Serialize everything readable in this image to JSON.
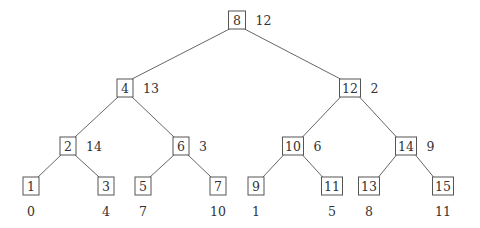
{
  "diagram": {
    "type": "binary-tree",
    "colors": {
      "edge": "#555555",
      "box_stroke": "#555555",
      "text": "#333333",
      "background": "#ffffff"
    },
    "nodes": [
      {
        "id": "n8",
        "key": "8",
        "value": "12",
        "x": 237,
        "y": 20,
        "w": 17,
        "value_pos": "right"
      },
      {
        "id": "n4",
        "key": "4",
        "value": "13",
        "x": 125,
        "y": 88,
        "w": 16,
        "value_pos": "right"
      },
      {
        "id": "n12",
        "key": "12",
        "value": "2",
        "x": 350,
        "y": 88,
        "w": 21,
        "value_pos": "right"
      },
      {
        "id": "n2",
        "key": "2",
        "value": "14",
        "x": 68,
        "y": 146,
        "w": 16,
        "value_pos": "right"
      },
      {
        "id": "n6",
        "key": "6",
        "value": "3",
        "x": 181,
        "y": 146,
        "w": 16,
        "value_pos": "right"
      },
      {
        "id": "n10",
        "key": "10",
        "value": "6",
        "x": 293,
        "y": 146,
        "w": 21,
        "value_pos": "right"
      },
      {
        "id": "n14",
        "key": "14",
        "value": "9",
        "x": 406,
        "y": 146,
        "w": 21,
        "value_pos": "right"
      },
      {
        "id": "n1",
        "key": "1",
        "value": "0",
        "x": 31,
        "y": 186,
        "w": 16,
        "value_pos": "below"
      },
      {
        "id": "n3",
        "key": "3",
        "value": "4",
        "x": 106,
        "y": 186,
        "w": 16,
        "value_pos": "below"
      },
      {
        "id": "n5",
        "key": "5",
        "value": "7",
        "x": 143,
        "y": 186,
        "w": 16,
        "value_pos": "below"
      },
      {
        "id": "n7",
        "key": "7",
        "value": "10",
        "x": 218,
        "y": 186,
        "w": 16,
        "value_pos": "below"
      },
      {
        "id": "n9",
        "key": "9",
        "value": "1",
        "x": 256,
        "y": 186,
        "w": 16,
        "value_pos": "below"
      },
      {
        "id": "n11",
        "key": "11",
        "value": "5",
        "x": 332,
        "y": 186,
        "w": 21,
        "value_pos": "below"
      },
      {
        "id": "n13",
        "key": "13",
        "value": "8",
        "x": 369,
        "y": 186,
        "w": 21,
        "value_pos": "below"
      },
      {
        "id": "n15",
        "key": "15",
        "value": "11",
        "x": 443,
        "y": 186,
        "w": 21,
        "value_pos": "below"
      }
    ],
    "edges": [
      [
        "n8",
        "n4"
      ],
      [
        "n8",
        "n12"
      ],
      [
        "n4",
        "n2"
      ],
      [
        "n4",
        "n6"
      ],
      [
        "n12",
        "n10"
      ],
      [
        "n12",
        "n14"
      ],
      [
        "n2",
        "n1"
      ],
      [
        "n2",
        "n3"
      ],
      [
        "n6",
        "n5"
      ],
      [
        "n6",
        "n7"
      ],
      [
        "n10",
        "n9"
      ],
      [
        "n10",
        "n11"
      ],
      [
        "n14",
        "n13"
      ],
      [
        "n14",
        "n15"
      ]
    ]
  }
}
